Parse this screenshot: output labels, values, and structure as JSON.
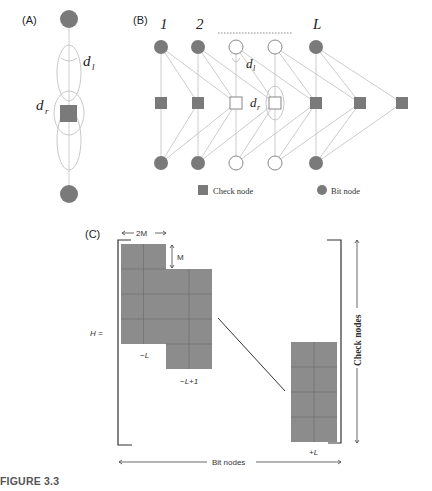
{
  "panels": {
    "A": {
      "label": "(A)",
      "d_l": "d",
      "d_l_sub": "l",
      "d_r": "d",
      "d_r_sub": "r"
    },
    "B": {
      "label": "(B)",
      "column_labels": [
        "1",
        "2",
        "L"
      ],
      "d_l": "d",
      "d_l_sub": "l",
      "d_r": "d",
      "d_r_sub": "r",
      "legend": {
        "check_node": "Check node",
        "bit_node": "Bit node"
      }
    },
    "C": {
      "label": "(C)",
      "width_label": "2M",
      "height_label": "M",
      "matrix_label": "H =",
      "block_labels": [
        "−L",
        "−L+1",
        "+L"
      ],
      "y_axis_label": "Check nodes",
      "x_axis_label": "Bit nodes"
    }
  },
  "caption": "FIGURE 3.3",
  "colors": {
    "node_fill": "#7a7a7a",
    "edge": "#bdbdbd",
    "block_fill": "#8c8c8c",
    "block_grid": "#6e6e6e",
    "text": "#222222"
  }
}
